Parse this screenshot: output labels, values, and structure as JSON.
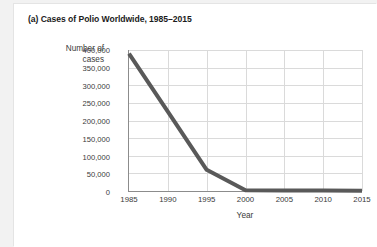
{
  "figure": {
    "title": "(a) Cases of Polio Worldwide, 1985–2015",
    "y_axis_label_line1": "Number of",
    "y_axis_label_line2": "cases",
    "x_axis_label": "Year"
  },
  "colors": {
    "line": "#595959",
    "grid": "#dadada",
    "axis": "#8c8c8c",
    "text": "#3a3a3a",
    "title": "#1b1b1b",
    "panel": "#ffffff",
    "page": "#f2f2f2"
  },
  "chart_data": {
    "type": "line",
    "title": "(a) Cases of Polio Worldwide, 1985–2015",
    "xlabel": "Year",
    "ylabel": "Number of cases",
    "x": [
      1985,
      1990,
      1995,
      2000,
      2005,
      2010,
      2015
    ],
    "values": [
      390000,
      225000,
      60000,
      2000,
      1500,
      1300,
      1000
    ],
    "series": [
      {
        "name": "Cases of polio worldwide",
        "values": [
          390000,
          225000,
          60000,
          2000,
          1500,
          1300,
          1000
        ]
      }
    ],
    "xlim": [
      1985,
      2015
    ],
    "ylim": [
      0,
      400000
    ],
    "xticks": [
      1985,
      1990,
      1995,
      2000,
      2005,
      2010,
      2015
    ],
    "xtick_labels": [
      "1985",
      "1990",
      "1995",
      "2000",
      "2005",
      "2010",
      "2015"
    ],
    "yticks": [
      0,
      50000,
      100000,
      150000,
      200000,
      250000,
      300000,
      350000,
      400000
    ],
    "ytick_labels": [
      "0",
      "50,000",
      "100,000",
      "150,000",
      "200,000",
      "250,000",
      "300,000",
      "350,000",
      "400,000"
    ],
    "grid": true,
    "legend": false
  }
}
